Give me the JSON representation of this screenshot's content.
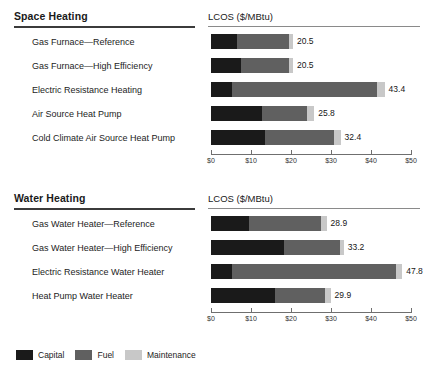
{
  "chart_data": {
    "type": "bar",
    "subtype": "stacked-horizontal",
    "title": "",
    "xlabel": "LCOS ($/MBtu)",
    "ylabel": "",
    "xlim": [
      0,
      50
    ],
    "xticks": [
      0,
      10,
      20,
      30,
      40,
      50
    ],
    "xtick_labels": [
      "$0",
      "$10",
      "$20",
      "$30",
      "$40",
      "$50"
    ],
    "grid": false,
    "legend_position": "bottom-left",
    "series": [
      {
        "name": "Capital",
        "color": "#1a1a1a"
      },
      {
        "name": "Fuel",
        "color": "#606060"
      },
      {
        "name": "Maintenance",
        "color": "#c8c8c8"
      }
    ],
    "panels": [
      {
        "title": "Space Heating",
        "axis_title": "LCOS ($/MBtu)",
        "categories": [
          "Gas Furnace—Reference",
          "Gas Furnace—High Efficiency",
          "Electric Resistance Heating",
          "Air Source Heat Pump",
          "Cold Climate Air Source Heat Pump"
        ],
        "totals": [
          20.5,
          20.5,
          43.4,
          25.8,
          32.4
        ],
        "total_labels": [
          "20.5",
          "20.5",
          "43.4",
          "25.8",
          "32.4"
        ],
        "values": {
          "Capital": [
            6.5,
            7.5,
            5.2,
            12.7,
            13.5
          ],
          "Fuel": [
            13.0,
            12.0,
            36.4,
            11.4,
            17.2
          ],
          "Maintenance": [
            1.0,
            1.0,
            1.8,
            1.7,
            1.7
          ]
        }
      },
      {
        "title": "Water Heating",
        "axis_title": "LCOS ($/MBtu)",
        "categories": [
          "Gas Water Heater—Reference",
          "Gas Water Heater—High Efficiency",
          "Electric Resistance Water Heater",
          "Heat Pump Water Heater"
        ],
        "totals": [
          28.9,
          33.2,
          47.8,
          29.9
        ],
        "total_labels": [
          "28.9",
          "33.2",
          "47.8",
          "29.9"
        ],
        "values": {
          "Capital": [
            9.5,
            18.2,
            5.2,
            16.0
          ],
          "Fuel": [
            17.9,
            14.0,
            41.0,
            12.4
          ],
          "Maintenance": [
            1.5,
            1.0,
            1.6,
            1.5
          ]
        }
      }
    ]
  },
  "legend": {
    "items": [
      {
        "label": "Capital",
        "color": "#1a1a1a"
      },
      {
        "label": "Fuel",
        "color": "#606060"
      },
      {
        "label": "Maintenance",
        "color": "#c8c8c8"
      }
    ]
  }
}
